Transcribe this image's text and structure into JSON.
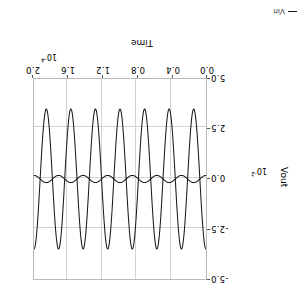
{
  "figure": {
    "rotation_degrees": 180,
    "background_color": "#ffffff",
    "frame_color": "#b9b9b9",
    "grid_color": "#d4d4d4",
    "trace_color": "#1a1a1a"
  },
  "axes": {
    "x": {
      "title": "Time",
      "exponent_base": "10",
      "exponent_power": "-4",
      "exponent_text": "10⁻⁴",
      "ticks": [
        "0.0",
        "0.4",
        "0.8",
        "1.2",
        "1.6",
        "2.0"
      ],
      "min": 0.0,
      "max": 2.0
    },
    "y": {
      "title": "Vout",
      "exponent_base": "10",
      "exponent_power": "-2",
      "exponent_text": "10⁻²",
      "ticks": [
        "-5.0",
        "-2.5",
        "0.0",
        "2.5",
        "5.0"
      ],
      "min": -5.0,
      "max": 5.0
    }
  },
  "legend": {
    "entries": [
      {
        "label": "Vin",
        "color": "#1a1a1a"
      }
    ]
  },
  "chart_data": {
    "type": "line",
    "title": "",
    "xlabel": "Time",
    "ylabel": "Vout",
    "x_unit_multiplier": "10^-4",
    "y_unit_multiplier": "10^-2",
    "xlim": [
      0.0,
      2.0
    ],
    "ylim": [
      -5.0,
      5.0
    ],
    "xticks": [
      0.0,
      0.4,
      0.8,
      1.2,
      1.6,
      2.0
    ],
    "yticks": [
      -5.0,
      -2.5,
      0.0,
      2.5,
      5.0
    ],
    "grid": true,
    "legend_position": "outside-top-right",
    "cycles_visible": 7,
    "series": [
      {
        "name": "Vout",
        "waveform": "sine",
        "amplitude": 3.5,
        "offset": 0.0,
        "cycles": 7,
        "phase_deg": 90,
        "color": "#1a1a1a"
      },
      {
        "name": "Vin",
        "waveform": "sine",
        "amplitude": 0.18,
        "offset": 0.0,
        "cycles": 7,
        "phase_deg": 270,
        "color": "#1a1a1a"
      }
    ]
  }
}
